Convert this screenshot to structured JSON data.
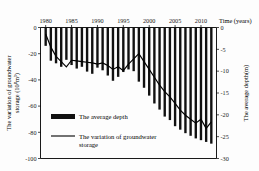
{
  "chart_data": {
    "type": "bar",
    "title": "",
    "xlabel": "Time (years)",
    "ylabel": "The variation of groundwater storage (10⁸m³)",
    "y2label": "The average depth(m)",
    "grid": false,
    "legend_position": "center-left",
    "xlim": [
      1979,
      2013
    ],
    "ylim": [
      -100,
      0
    ],
    "y2lim": [
      -30,
      0
    ],
    "x_axis_position": "top",
    "x_ticks": [
      1980,
      1985,
      1990,
      1995,
      2000,
      2005,
      2010
    ],
    "x_tick_labels": [
      "1980",
      "1985",
      "1990",
      "1995",
      "2000",
      "2005",
      "2010"
    ],
    "y_ticks": [
      0,
      -20,
      -40,
      -60,
      -80,
      -100
    ],
    "y_tick_labels": [
      "0",
      "-20",
      "-40",
      "-60",
      "-80",
      "-100"
    ],
    "y2_ticks": [
      0,
      -5,
      -10,
      -15,
      -20,
      -25,
      -30
    ],
    "y2_tick_labels": [
      "0",
      "-5",
      "-10",
      "-15",
      "-20",
      "-25",
      "-30"
    ],
    "x": [
      1980,
      1981,
      1982,
      1983,
      1984,
      1985,
      1986,
      1987,
      1988,
      1989,
      1990,
      1991,
      1992,
      1993,
      1994,
      1995,
      1996,
      1997,
      1998,
      1999,
      2000,
      2001,
      2002,
      2003,
      2004,
      2005,
      2006,
      2007,
      2008,
      2009,
      2010,
      2011,
      2012
    ],
    "series": [
      {
        "name": "The average depth",
        "type": "bar",
        "axis": "right",
        "units": "m",
        "values": [
          -4.2,
          -7.6,
          -8.2,
          -9.0,
          -7.4,
          -8.6,
          -9.4,
          -9.0,
          -10.1,
          -10.6,
          -9.2,
          -9.8,
          -11.0,
          -12.2,
          -11.3,
          -10.2,
          -9.6,
          -10.0,
          -12.4,
          -13.8,
          -15.6,
          -17.4,
          -18.8,
          -20.4,
          -21.2,
          -22.6,
          -23.4,
          -24.2,
          -24.8,
          -25.4,
          -25.8,
          -26.2,
          -26.6
        ]
      },
      {
        "name": "The variation of groundwater storage",
        "type": "line",
        "axis": "left",
        "units": "10⁸m³",
        "values": [
          -5.0,
          -15.0,
          -22.0,
          -26.0,
          -30.0,
          -25.0,
          -25.5,
          -26.0,
          -26.5,
          -27.0,
          -28.0,
          -27.0,
          -29.0,
          -32.0,
          -30.0,
          -33.0,
          -28.0,
          -24.0,
          -20.0,
          -26.0,
          -32.0,
          -38.0,
          -44.0,
          -49.0,
          -53.0,
          -58.0,
          -63.0,
          -67.0,
          -70.0,
          -73.0,
          -70.0,
          -77.0,
          -72.0
        ]
      }
    ],
    "legend": [
      {
        "label": "The average depth",
        "marker": "bar",
        "color": "#111111"
      },
      {
        "label": "The variation of groundwater storage",
        "marker": "line",
        "color": "#000000"
      }
    ]
  }
}
